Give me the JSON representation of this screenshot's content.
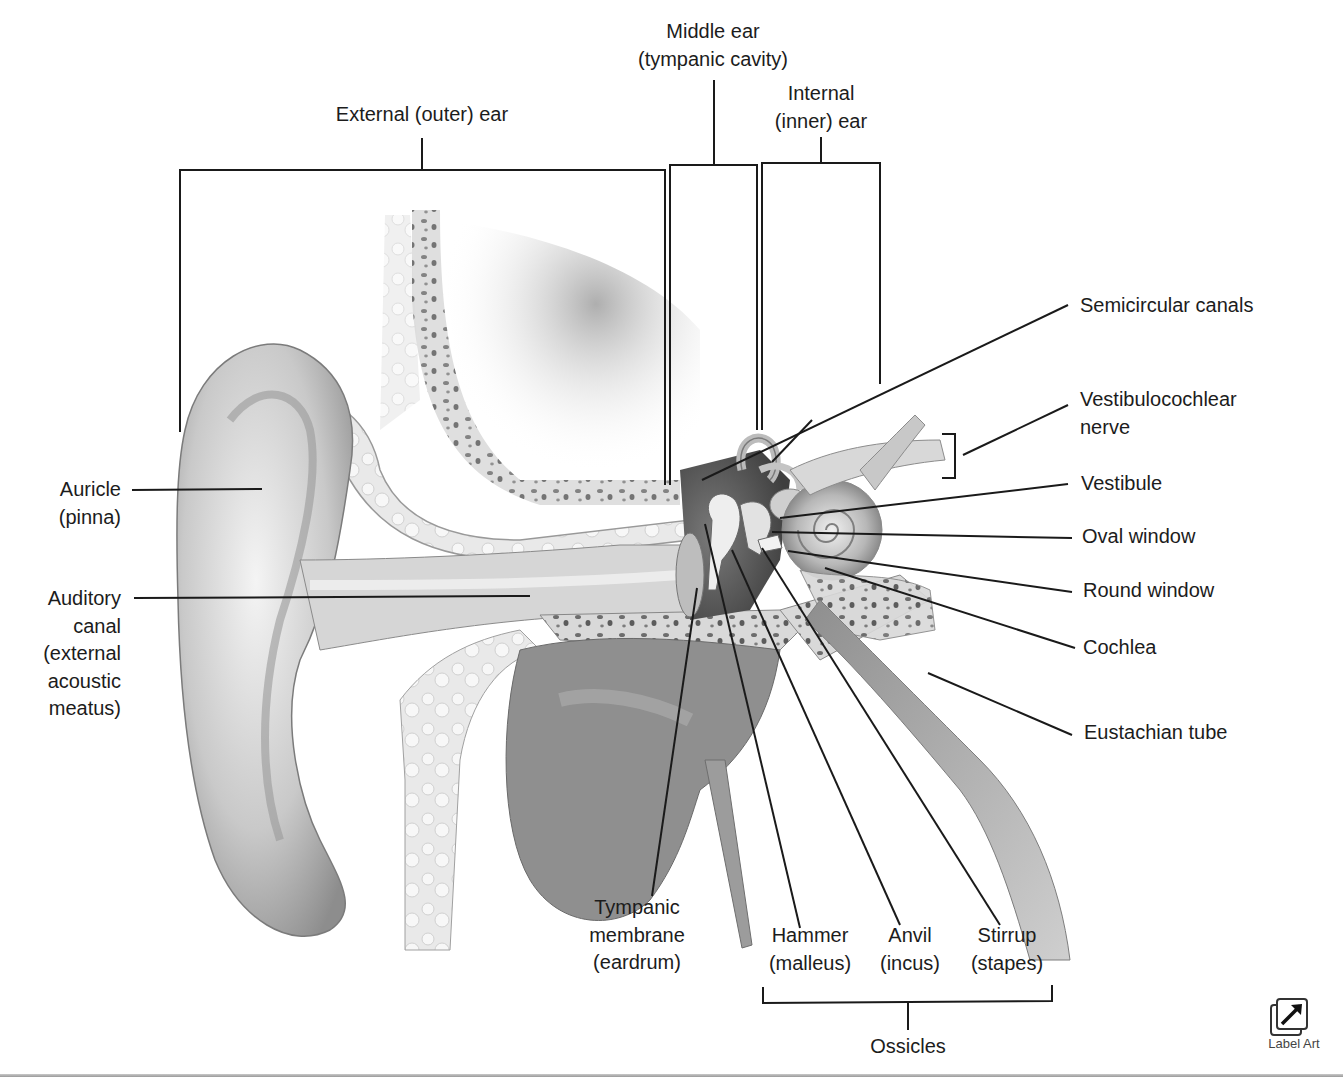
{
  "diagram": {
    "regions": [
      {
        "id": "external",
        "label": [
          "External (outer) ear"
        ]
      },
      {
        "id": "middle",
        "label": [
          "Middle ear",
          "(tympanic cavity)"
        ]
      },
      {
        "id": "internal",
        "label": [
          "Internal",
          "(inner) ear"
        ]
      }
    ],
    "left_labels": [
      {
        "id": "auricle",
        "lines": [
          "Auricle",
          "(pinna)"
        ]
      },
      {
        "id": "auditory-canal",
        "lines": [
          "Auditory",
          "canal",
          "(external",
          "acoustic",
          "meatus)"
        ]
      }
    ],
    "right_labels": [
      {
        "id": "semicircular-canals",
        "lines": [
          "Semicircular canals"
        ]
      },
      {
        "id": "vestibulocochlear-nerve",
        "lines": [
          "Vestibulocochlear",
          "nerve"
        ]
      },
      {
        "id": "vestibule",
        "lines": [
          "Vestibule"
        ]
      },
      {
        "id": "oval-window",
        "lines": [
          "Oval window"
        ]
      },
      {
        "id": "round-window",
        "lines": [
          "Round window"
        ]
      },
      {
        "id": "cochlea",
        "lines": [
          "Cochlea"
        ]
      },
      {
        "id": "eustachian-tube",
        "lines": [
          "Eustachian tube"
        ]
      }
    ],
    "bottom_labels": [
      {
        "id": "tympanic-membrane",
        "lines": [
          "Tympanic",
          "membrane",
          "(eardrum)"
        ]
      },
      {
        "id": "hammer",
        "lines": [
          "Hammer",
          "(malleus)"
        ]
      },
      {
        "id": "anvil",
        "lines": [
          "Anvil",
          "(incus)"
        ]
      },
      {
        "id": "stirrup",
        "lines": [
          "Stirrup",
          "(stapes)"
        ]
      }
    ],
    "group_labels": {
      "ossicles": "Ossicles"
    }
  },
  "controls": {
    "label_art": {
      "label": "Label Art",
      "icon": "arrow-out-icon"
    }
  },
  "colors": {
    "line": "#1a1a1a",
    "text": "#1c1c1c",
    "tissue_light": "#ededed",
    "tissue_mid": "#a8a8a8",
    "tissue_dark": "#5a5a5a",
    "bone": "#dcdcdc"
  }
}
